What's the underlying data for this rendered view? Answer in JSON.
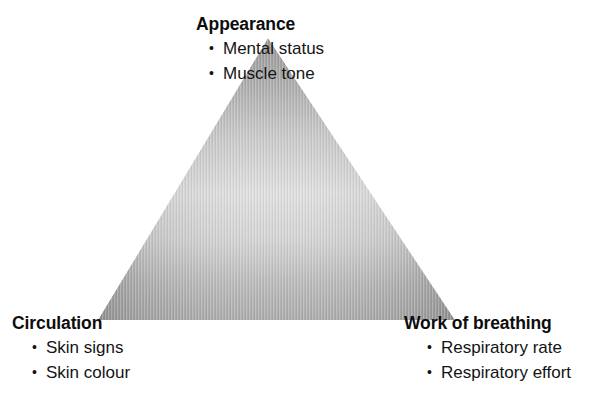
{
  "diagram": {
    "name": "Pediatric Assessment Triangle",
    "background_color": "#ffffff",
    "shape": "triangle",
    "fill_style": "gray gradient with fine vertical stripes",
    "colors": {
      "fill_dark": "#8a8a8a",
      "fill_mid": "#aeaeae",
      "fill_light": "#dcdcdc",
      "text": "#111111"
    },
    "vertices": {
      "apex": {
        "x": 268,
        "y": 38
      },
      "bottom_left": {
        "x": 98,
        "y": 320
      },
      "bottom_right": {
        "x": 455,
        "y": 320
      }
    }
  },
  "corners": [
    {
      "id": "appearance",
      "title": "Appearance",
      "position": "top",
      "bullets": [
        "Mental status",
        "Muscle tone"
      ]
    },
    {
      "id": "circulation",
      "title": "Circulation",
      "position": "bottom-left",
      "bullets": [
        "Skin signs",
        "Skin colour"
      ]
    },
    {
      "id": "work-of-breathing",
      "title": "Work of breathing",
      "position": "bottom-right",
      "bullets": [
        "Respiratory rate",
        "Respiratory effort"
      ]
    }
  ]
}
